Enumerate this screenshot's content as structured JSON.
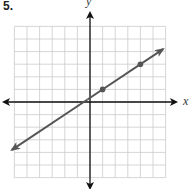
{
  "problem": {
    "number": "5."
  },
  "axes": {
    "x_label": "x",
    "y_label": "y"
  },
  "chart_data": {
    "type": "line",
    "title": "",
    "xlabel": "x",
    "ylabel": "y",
    "xlim": [
      -6,
      6
    ],
    "ylim": [
      -6,
      6
    ],
    "grid": true,
    "grid_step": 1,
    "tick_labels": false,
    "series": [
      {
        "name": "line",
        "equation": "y = (2/3)x + 1/3",
        "slope": 0.6667,
        "intercept": 0.3333,
        "extends_both_directions": true,
        "segment_from": {
          "x": -6.2,
          "y": -3.8
        },
        "segment_to": {
          "x": 5.8,
          "y": 4.2
        },
        "marked_points": [
          {
            "x": 1,
            "y": 1
          },
          {
            "x": 4,
            "y": 3
          }
        ],
        "color": "#555555"
      }
    ],
    "colors": {
      "grid": "#cccccc",
      "axes": "#111111",
      "line": "#555555",
      "points": "#555555"
    }
  }
}
